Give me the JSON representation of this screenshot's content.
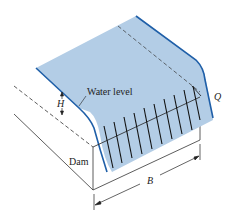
{
  "diagram": {
    "type": "weir-over-dam",
    "labels": {
      "water_level": "Water level",
      "flow_rate": "Q",
      "head": "H",
      "dam": "Dam",
      "width": "B"
    },
    "colors": {
      "water_fill": "#b3cde6",
      "water_edge": "#1f5fa8",
      "lines": "#222222",
      "background": "#ffffff"
    }
  }
}
